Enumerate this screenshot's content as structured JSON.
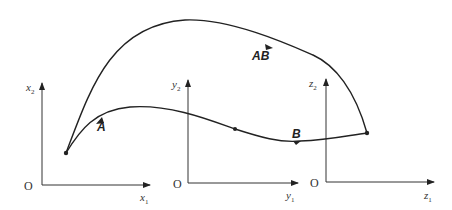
{
  "diagram": {
    "colors": {
      "stroke": "#222222",
      "background": "#ffffff"
    },
    "axes": [
      {
        "origin_label": "O",
        "horizontal_label": "x",
        "horizontal_sub": "1",
        "vertical_label": "x",
        "vertical_sub": "2"
      },
      {
        "origin_label": "O",
        "horizontal_label": "y",
        "horizontal_sub": "1",
        "vertical_label": "y",
        "vertical_sub": "2"
      },
      {
        "origin_label": "O",
        "horizontal_label": "z",
        "horizontal_sub": "1",
        "vertical_label": "z",
        "vertical_sub": "2"
      }
    ],
    "curves": [
      {
        "label": "A",
        "description": "lower path through intermediate point"
      },
      {
        "label": "B",
        "description": "lower path continuation to end point"
      },
      {
        "label": "AB",
        "description": "upper direct path"
      }
    ]
  }
}
